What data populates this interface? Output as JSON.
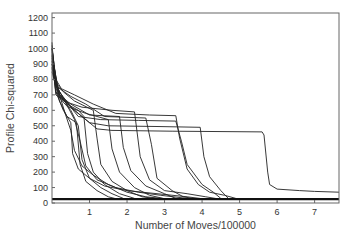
{
  "chart_data": {
    "type": "line",
    "title": "",
    "xlabel": "Number of Moves/100000",
    "ylabel": "Profile Chi-squared",
    "xlim": [
      0,
      7.65
    ],
    "ylim": [
      0,
      1230
    ],
    "xticks": [
      1,
      2,
      3,
      4,
      5,
      6,
      7
    ],
    "yticks": [
      0,
      100,
      200,
      300,
      400,
      500,
      600,
      700,
      800,
      900,
      1000,
      1100,
      1200
    ],
    "grid": false,
    "legend": null,
    "style": {
      "line_color": "#222222",
      "axis_color": "#666666",
      "baseline_value": 25
    },
    "series": [
      {
        "name": "run-1",
        "points": [
          [
            0,
            1040
          ],
          [
            0.05,
            820
          ],
          [
            0.2,
            720
          ],
          [
            0.5,
            620
          ],
          [
            0.8,
            560
          ],
          [
            1.2,
            480
          ],
          [
            1.6,
            470
          ],
          [
            3.2,
            465
          ],
          [
            5.6,
            460
          ],
          [
            5.65,
            440
          ],
          [
            5.75,
            200
          ],
          [
            5.8,
            120
          ],
          [
            6.0,
            90
          ],
          [
            6.6,
            80
          ],
          [
            7.0,
            75
          ],
          [
            7.65,
            70
          ]
        ]
      },
      {
        "name": "run-2",
        "points": [
          [
            0,
            1000
          ],
          [
            0.1,
            760
          ],
          [
            0.3,
            680
          ],
          [
            0.6,
            600
          ],
          [
            1.0,
            520
          ],
          [
            1.5,
            500
          ],
          [
            2.8,
            495
          ],
          [
            3.95,
            490
          ],
          [
            4.05,
            300
          ],
          [
            4.2,
            170
          ],
          [
            4.5,
            80
          ],
          [
            4.7,
            30
          ]
        ]
      },
      {
        "name": "run-3",
        "points": [
          [
            0,
            980
          ],
          [
            0.1,
            700
          ],
          [
            0.4,
            650
          ],
          [
            0.7,
            560
          ],
          [
            1.3,
            540
          ],
          [
            2.3,
            535
          ],
          [
            3.3,
            530
          ],
          [
            3.45,
            400
          ],
          [
            3.6,
            250
          ],
          [
            4.0,
            120
          ],
          [
            4.3,
            70
          ],
          [
            4.5,
            30
          ]
        ]
      },
      {
        "name": "run-4",
        "points": [
          [
            0,
            960
          ],
          [
            0.15,
            750
          ],
          [
            0.5,
            690
          ],
          [
            0.9,
            640
          ],
          [
            1.4,
            560
          ],
          [
            2.5,
            550
          ],
          [
            2.65,
            380
          ],
          [
            2.8,
            160
          ],
          [
            3.2,
            80
          ],
          [
            3.5,
            40
          ],
          [
            3.8,
            28
          ]
        ]
      },
      {
        "name": "run-5",
        "points": [
          [
            0,
            1020
          ],
          [
            0.1,
            780
          ],
          [
            0.3,
            720
          ],
          [
            0.6,
            660
          ],
          [
            1.1,
            600
          ],
          [
            1.2,
            420
          ],
          [
            1.3,
            250
          ],
          [
            1.6,
            140
          ],
          [
            2.0,
            80
          ],
          [
            2.4,
            40
          ],
          [
            2.8,
            28
          ]
        ]
      },
      {
        "name": "run-6",
        "points": [
          [
            0,
            900
          ],
          [
            0.2,
            700
          ],
          [
            0.4,
            640
          ],
          [
            0.7,
            600
          ],
          [
            0.85,
            560
          ],
          [
            0.95,
            320
          ],
          [
            1.1,
            200
          ],
          [
            1.4,
            120
          ],
          [
            1.8,
            60
          ],
          [
            2.2,
            30
          ]
        ]
      },
      {
        "name": "run-7",
        "points": [
          [
            0,
            880
          ],
          [
            0.2,
            680
          ],
          [
            0.5,
            600
          ],
          [
            0.7,
            500
          ],
          [
            0.8,
            280
          ],
          [
            1.0,
            160
          ],
          [
            1.3,
            100
          ],
          [
            1.6,
            60
          ],
          [
            1.9,
            30
          ]
        ]
      },
      {
        "name": "run-8",
        "points": [
          [
            0,
            850
          ],
          [
            0.2,
            660
          ],
          [
            0.4,
            560
          ],
          [
            0.65,
            520
          ],
          [
            0.75,
            250
          ],
          [
            0.9,
            140
          ],
          [
            1.2,
            80
          ],
          [
            1.5,
            40
          ],
          [
            1.7,
            28
          ]
        ]
      },
      {
        "name": "run-9",
        "points": [
          [
            0,
            1000
          ],
          [
            0.15,
            720
          ],
          [
            0.45,
            620
          ],
          [
            0.9,
            580
          ],
          [
            1.5,
            540
          ],
          [
            1.6,
            350
          ],
          [
            1.8,
            200
          ],
          [
            2.2,
            100
          ],
          [
            2.6,
            50
          ],
          [
            3.0,
            28
          ]
        ]
      },
      {
        "name": "run-10",
        "points": [
          [
            0,
            950
          ],
          [
            0.2,
            700
          ],
          [
            0.5,
            640
          ],
          [
            1.0,
            570
          ],
          [
            1.8,
            560
          ],
          [
            1.9,
            360
          ],
          [
            2.1,
            210
          ],
          [
            2.5,
            110
          ],
          [
            3.0,
            60
          ],
          [
            3.3,
            30
          ]
        ]
      },
      {
        "name": "run-11",
        "points": [
          [
            0,
            920
          ],
          [
            0.1,
            720
          ],
          [
            0.3,
            660
          ],
          [
            0.8,
            620
          ],
          [
            1.6,
            600
          ],
          [
            2.2,
            590
          ],
          [
            2.35,
            300
          ],
          [
            2.6,
            150
          ],
          [
            3.0,
            80
          ],
          [
            3.6,
            60
          ],
          [
            4.1,
            40
          ],
          [
            4.4,
            28
          ]
        ]
      },
      {
        "name": "run-12",
        "points": [
          [
            0,
            900
          ],
          [
            0.1,
            760
          ],
          [
            0.3,
            680
          ],
          [
            0.6,
            540
          ],
          [
            0.75,
            400
          ],
          [
            0.9,
            240
          ],
          [
            1.2,
            150
          ],
          [
            1.7,
            100
          ],
          [
            2.3,
            70
          ],
          [
            2.9,
            50
          ],
          [
            3.6,
            30
          ]
        ]
      },
      {
        "name": "run-13",
        "points": [
          [
            0,
            870
          ],
          [
            0.2,
            700
          ],
          [
            0.35,
            580
          ],
          [
            0.5,
            470
          ],
          [
            0.6,
            340
          ],
          [
            0.8,
            240
          ],
          [
            1.1,
            180
          ],
          [
            1.5,
            120
          ],
          [
            2.0,
            70
          ],
          [
            2.5,
            40
          ],
          [
            3.0,
            28
          ]
        ]
      },
      {
        "name": "run-14",
        "points": [
          [
            0,
            1000
          ],
          [
            0.1,
            800
          ],
          [
            0.25,
            740
          ],
          [
            0.6,
            700
          ],
          [
            1.1,
            640
          ],
          [
            1.7,
            580
          ],
          [
            2.6,
            570
          ],
          [
            3.3,
            565
          ],
          [
            3.4,
            420
          ],
          [
            3.6,
            220
          ],
          [
            3.9,
            120
          ],
          [
            4.2,
            70
          ],
          [
            4.6,
            50
          ],
          [
            4.9,
            30
          ]
        ]
      },
      {
        "name": "run-15",
        "points": [
          [
            0,
            940
          ],
          [
            0.1,
            720
          ],
          [
            0.3,
            600
          ],
          [
            0.5,
            520
          ],
          [
            0.55,
            320
          ],
          [
            0.7,
            220
          ],
          [
            1.0,
            160
          ],
          [
            1.4,
            110
          ],
          [
            2.0,
            80
          ],
          [
            2.8,
            60
          ],
          [
            3.6,
            40
          ],
          [
            4.0,
            28
          ]
        ]
      }
    ]
  }
}
